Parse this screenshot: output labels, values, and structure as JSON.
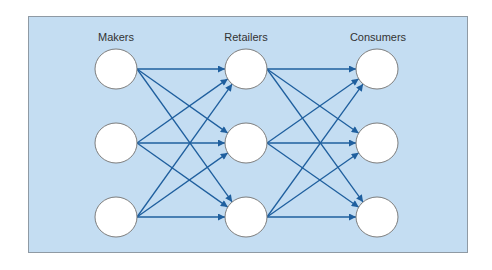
{
  "diagram": {
    "background": "#c4ddf2",
    "edge_color": "#1f5f9e",
    "columns": [
      {
        "label": "Makers",
        "x": 116,
        "label_x": 116
      },
      {
        "label": "Retailers",
        "x": 246,
        "label_x": 246
      },
      {
        "label": "Consumers",
        "x": 377,
        "label_x": 378
      }
    ],
    "rows_y": [
      69,
      143,
      217
    ],
    "node_rx": 21,
    "node_ry": 20,
    "edges": "fully connected: every node in each column points to every node in the next column"
  }
}
